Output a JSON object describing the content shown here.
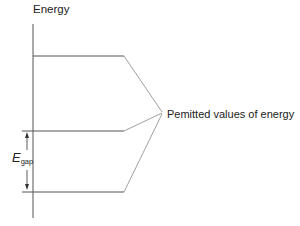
{
  "diagram": {
    "axis_label": "Energy",
    "annotation": "Pemitted values of energy",
    "gap_label": {
      "symbol": "E",
      "subscript": "gap"
    },
    "levels": [
      "upper level",
      "middle level",
      "lower level"
    ],
    "colors": {
      "line": "#555555",
      "pointer": "#888888",
      "text": "#222222"
    }
  }
}
